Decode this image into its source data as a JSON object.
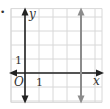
{
  "figure": {
    "bullet": "•",
    "axes": {
      "x_label": "x",
      "y_label": "y",
      "origin_label": "O",
      "x_tick_label": "1",
      "y_tick_label": "1"
    },
    "grid": {
      "x_min": -1,
      "x_max": 5.5,
      "y_min": -2.1,
      "y_max": 4.6,
      "step": 1
    },
    "graphed_line": {
      "equation": "x = 4",
      "type": "vertical",
      "x": 4,
      "color": "#8c8c8c"
    },
    "colors": {
      "axis": "#222222",
      "grid": "#d8d8d8",
      "line": "#8c8c8c"
    }
  }
}
